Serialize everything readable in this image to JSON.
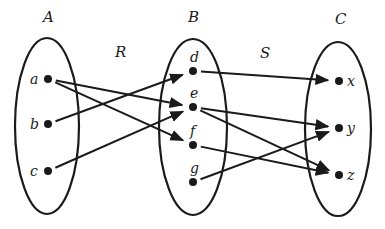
{
  "diagram": {
    "sets": [
      {
        "name": "A",
        "cx": 47,
        "cy": 126,
        "rx": 32,
        "ry": 88,
        "label_x": 43,
        "label_y": 22,
        "elements": [
          {
            "id": "a",
            "x": 48,
            "y": 79,
            "lx": 30,
            "ly": 84
          },
          {
            "id": "b",
            "x": 48,
            "y": 124,
            "lx": 30,
            "ly": 129
          },
          {
            "id": "c",
            "x": 48,
            "y": 171,
            "lx": 30,
            "ly": 176
          }
        ]
      },
      {
        "name": "B",
        "cx": 193,
        "cy": 127,
        "rx": 34,
        "ry": 88,
        "label_x": 188,
        "label_y": 22,
        "elements": [
          {
            "id": "d",
            "x": 193,
            "y": 71,
            "lx": 190,
            "ly": 62
          },
          {
            "id": "e",
            "x": 193,
            "y": 107,
            "lx": 190,
            "ly": 98
          },
          {
            "id": "f",
            "x": 193,
            "y": 145,
            "lx": 190,
            "ly": 136
          },
          {
            "id": "g",
            "x": 193,
            "y": 182,
            "lx": 190,
            "ly": 173
          }
        ]
      },
      {
        "name": "C",
        "cx": 338,
        "cy": 129,
        "rx": 33,
        "ry": 87,
        "label_x": 335,
        "label_y": 24,
        "elements": [
          {
            "id": "x",
            "x": 339,
            "y": 81,
            "lx": 347,
            "ly": 86
          },
          {
            "id": "y",
            "x": 339,
            "y": 128,
            "lx": 347,
            "ly": 133
          },
          {
            "id": "z",
            "x": 339,
            "y": 175,
            "lx": 347,
            "ly": 180
          }
        ]
      }
    ],
    "relations": [
      {
        "name": "R",
        "label_x": 115,
        "label_y": 57,
        "pairs": [
          [
            "a",
            "e"
          ],
          [
            "a",
            "f"
          ],
          [
            "b",
            "d"
          ],
          [
            "c",
            "e"
          ]
        ]
      },
      {
        "name": "S",
        "label_x": 260,
        "label_y": 58,
        "pairs": [
          [
            "d",
            "x"
          ],
          [
            "e",
            "y"
          ],
          [
            "e",
            "z"
          ],
          [
            "f",
            "z"
          ],
          [
            "g",
            "y"
          ]
        ]
      }
    ]
  }
}
